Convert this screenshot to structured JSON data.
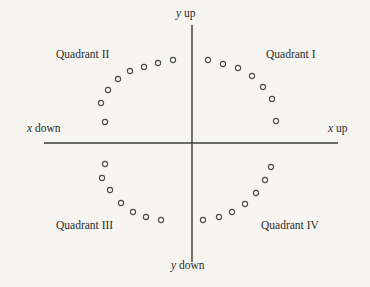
{
  "figure": {
    "background_color": "#f7f5f1",
    "line_color": "#3a3a3a",
    "marker_color": "#4a4a4a"
  },
  "axis_labels": {
    "y_up": {
      "symbol": "y",
      "word": "up"
    },
    "y_down": {
      "symbol": "y",
      "word": "down"
    },
    "x_up": {
      "symbol": "x",
      "word": "up"
    },
    "x_down": {
      "symbol": "x",
      "word": "down"
    }
  },
  "quadrants": {
    "q1": "Quadrant I",
    "q2": "Quadrant II",
    "q3": "Quadrant III",
    "q4": "Quadrant IV"
  },
  "chart_data": {
    "type": "scatter",
    "title": "",
    "subtitle": "",
    "xlabel": "x",
    "ylabel": "y",
    "grid": false,
    "legend": null,
    "marker": "open-circle",
    "marker_radius_px": 2.6,
    "origin_px": [
      192,
      143
    ],
    "axis_extent_px": {
      "x_left": 44,
      "x_right": 338,
      "y_top": 25,
      "y_bottom": 262
    },
    "points_px": [
      [
        105,
        122
      ],
      [
        101,
        103
      ],
      [
        108,
        90
      ],
      [
        118,
        79
      ],
      [
        130,
        71
      ],
      [
        144,
        67
      ],
      [
        158,
        63
      ],
      [
        173,
        60
      ],
      [
        208,
        60
      ],
      [
        223,
        64
      ],
      [
        238,
        68
      ],
      [
        252,
        76
      ],
      [
        263,
        87
      ],
      [
        272,
        99
      ],
      [
        276,
        121
      ],
      [
        105,
        164
      ],
      [
        102,
        178
      ],
      [
        110,
        190
      ],
      [
        121,
        203
      ],
      [
        133,
        212
      ],
      [
        146,
        217
      ],
      [
        161,
        220
      ],
      [
        203,
        220
      ],
      [
        219,
        217
      ],
      [
        232,
        212
      ],
      [
        245,
        204
      ],
      [
        256,
        193
      ],
      [
        265,
        180
      ],
      [
        271,
        167
      ]
    ]
  }
}
